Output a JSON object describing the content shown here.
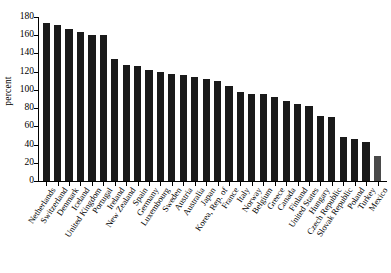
{
  "chart_data": {
    "type": "bar",
    "title": "",
    "xlabel": "",
    "ylabel": "percent",
    "ylim": [
      0,
      180
    ],
    "yticks": [
      0,
      20,
      40,
      60,
      80,
      100,
      120,
      140,
      160,
      180
    ],
    "grid": false,
    "legend": null,
    "categories": [
      "Netherlands",
      "Switzerland",
      "Denmark",
      "Iceland",
      "United Kingdom",
      "Portugal",
      "Ireland",
      "New Zealand",
      "Spain",
      "Germany",
      "Luxembourg",
      "Sweden",
      "Austria",
      "Australia",
      "Japan",
      "Korea, Rep. of",
      "France",
      "Italy",
      "Norway",
      "Belgium",
      "Greece",
      "Canada",
      "Finland",
      "United States",
      "Hungary",
      "Czech Republic",
      "Slovak Republic",
      "Poland",
      "Turkey",
      "Mexico"
    ],
    "values": [
      173,
      171,
      167,
      164,
      160,
      160,
      134,
      127,
      126,
      122,
      120,
      118,
      116,
      114,
      112,
      110,
      104,
      98,
      96,
      95,
      92,
      88,
      85,
      82,
      71,
      70,
      48,
      46,
      43,
      28
    ]
  },
  "style": {
    "bar_color": "#1a1a1a",
    "last_bar_color": "#4a4a4a",
    "axis_color": "#000000",
    "background": "#ffffff"
  }
}
